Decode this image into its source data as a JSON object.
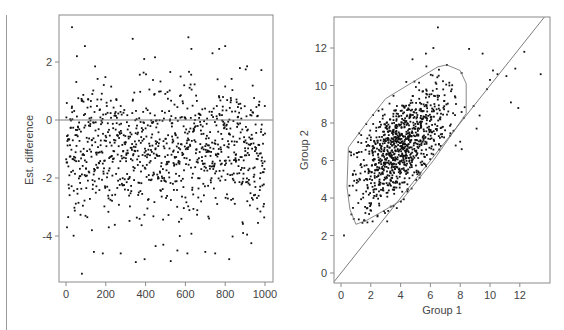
{
  "chart_data": [
    {
      "type": "scatter",
      "title": "",
      "xlabel": "",
      "ylabel": "Est. difference",
      "xlim": [
        -20,
        1020
      ],
      "ylim": [
        -5.6,
        3.6
      ],
      "x_ticks": [
        0,
        200,
        400,
        600,
        800,
        1000
      ],
      "y_ticks": [
        -4,
        -2,
        0,
        2
      ],
      "grid": false,
      "legend": null,
      "reference_line": {
        "type": "horizontal",
        "y": 0
      },
      "n_points": 1000,
      "distribution": {
        "x": "index 1..1000",
        "y_mean": -1.0,
        "y_sd": 1.2
      },
      "notable_points": [
        {
          "x": 30,
          "y": 3.2
        },
        {
          "x": 95,
          "y": 2.55
        },
        {
          "x": 55,
          "y": 2.2
        },
        {
          "x": 335,
          "y": 2.8
        },
        {
          "x": 615,
          "y": 2.85
        },
        {
          "x": 630,
          "y": 2.45
        },
        {
          "x": 800,
          "y": 2.55
        },
        {
          "x": 770,
          "y": 2.45
        },
        {
          "x": 910,
          "y": 1.85
        },
        {
          "x": 80,
          "y": -5.3
        },
        {
          "x": 395,
          "y": -4.8
        },
        {
          "x": 820,
          "y": -4.8
        },
        {
          "x": 140,
          "y": -4.55
        },
        {
          "x": 185,
          "y": -4.6
        },
        {
          "x": 275,
          "y": -4.6
        },
        {
          "x": 450,
          "y": -4.35
        },
        {
          "x": 560,
          "y": -4.5
        },
        {
          "x": 610,
          "y": -4.6
        },
        {
          "x": 700,
          "y": -4.55
        },
        {
          "x": 750,
          "y": -4.6
        },
        {
          "x": 910,
          "y": -3.95
        },
        {
          "x": 5,
          "y": -3.7
        },
        {
          "x": 130,
          "y": -3.8
        },
        {
          "x": 215,
          "y": -3.7
        }
      ]
    },
    {
      "type": "scatter",
      "title": "",
      "xlabel": "Group 1",
      "ylabel": "Group 2",
      "xlim": [
        -0.4,
        14.0
      ],
      "ylim": [
        -0.6,
        13.6
      ],
      "x_ticks": [
        0,
        2,
        4,
        6,
        8,
        10,
        12
      ],
      "y_ticks": [
        0,
        2,
        4,
        6,
        8,
        10,
        12
      ],
      "grid": false,
      "legend": null,
      "reference_line": {
        "type": "identity",
        "slope": 1,
        "intercept": 0
      },
      "n_points": 1000,
      "distribution": {
        "x_mean": 3.9,
        "x_sd": 1.6,
        "y_mean": 6.6,
        "y_sd": 1.6,
        "correlation": 0.6
      },
      "hull_polygon": [
        [
          0.5,
          6.7
        ],
        [
          1.9,
          8.2
        ],
        [
          3.0,
          9.3
        ],
        [
          6.5,
          11.0
        ],
        [
          7.1,
          11.1
        ],
        [
          8.0,
          10.8
        ],
        [
          8.4,
          10.1
        ],
        [
          8.4,
          8.5
        ],
        [
          7.7,
          7.7
        ],
        [
          6.2,
          6.0
        ],
        [
          4.1,
          3.9
        ],
        [
          2.6,
          3.2
        ],
        [
          1.7,
          2.8
        ],
        [
          1.0,
          2.6
        ],
        [
          0.6,
          3.4
        ],
        [
          0.4,
          4.6
        ],
        [
          0.5,
          6.7
        ]
      ],
      "notable_points": [
        {
          "x": 0.2,
          "y": 2.0
        },
        {
          "x": 3.1,
          "y": 2.75
        },
        {
          "x": 6.5,
          "y": 13.1
        },
        {
          "x": 6.2,
          "y": 12.0
        },
        {
          "x": 5.7,
          "y": 11.7
        },
        {
          "x": 4.8,
          "y": 11.4
        },
        {
          "x": 8.6,
          "y": 11.95
        },
        {
          "x": 9.5,
          "y": 11.7
        },
        {
          "x": 12.3,
          "y": 11.8
        },
        {
          "x": 13.4,
          "y": 10.6
        },
        {
          "x": 11.7,
          "y": 10.9
        },
        {
          "x": 11.1,
          "y": 10.5
        },
        {
          "x": 10.5,
          "y": 10.6
        },
        {
          "x": 10.2,
          "y": 10.8
        },
        {
          "x": 10.0,
          "y": 10.3
        },
        {
          "x": 9.8,
          "y": 9.8
        },
        {
          "x": 11.4,
          "y": 9.1
        },
        {
          "x": 11.9,
          "y": 8.8
        },
        {
          "x": 8.9,
          "y": 8.9
        },
        {
          "x": 9.3,
          "y": 8.4
        },
        {
          "x": 9.1,
          "y": 7.7
        },
        {
          "x": 8.1,
          "y": 6.6
        },
        {
          "x": 8.0,
          "y": 7.0
        },
        {
          "x": 7.7,
          "y": 6.8
        }
      ]
    }
  ],
  "left_plot": {
    "y_axis_label": "Est. difference",
    "x_tick_labels": [
      "0",
      "200",
      "400",
      "600",
      "800",
      "1000"
    ],
    "y_tick_labels": [
      "2",
      "0",
      "-2",
      "-4"
    ]
  },
  "right_plot": {
    "x_axis_label": "Group 1",
    "y_axis_label": "Group 2",
    "x_tick_labels": [
      "0",
      "2",
      "4",
      "6",
      "8",
      "10",
      "12"
    ],
    "y_tick_labels": [
      "0",
      "2",
      "4",
      "6",
      "8",
      "10",
      "12"
    ]
  },
  "colors": {
    "points": "#111111",
    "frame": "#8a8a8a",
    "reference_line": "#6e6e6e",
    "hull": "#7a7a7a",
    "tick_text": "#444444"
  }
}
